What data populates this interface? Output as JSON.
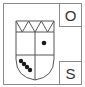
{
  "symbol": {
    "type": "coat-of-arms",
    "shield": {
      "chief": "zigzag",
      "zigzag_points": 3,
      "divisions": "quartered",
      "charges": [
        {
          "quarter": "upper-right",
          "shape": "dot",
          "count": 1
        },
        {
          "quarter": "lower-left",
          "shape": "dot-bend",
          "count": 4
        }
      ]
    },
    "labels": {
      "top_right": "O",
      "bottom_right": "S"
    }
  },
  "colors": {
    "frame": "#8a8a8a",
    "shield_line": "#555555",
    "charge": "#1a1a1a",
    "text": "#333333",
    "background": "#ffffff"
  }
}
